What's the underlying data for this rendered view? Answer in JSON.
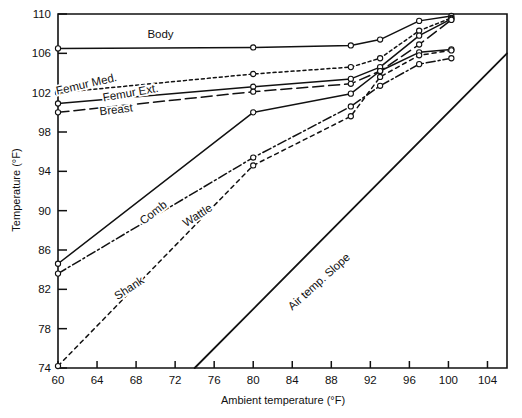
{
  "chart_data": {
    "type": "line",
    "title": "",
    "xlabel": "Ambient temperature (°F)",
    "ylabel": "Temperature (°F)",
    "xlim": [
      60,
      106
    ],
    "ylim": [
      74,
      110
    ],
    "xticks": [
      60,
      64,
      68,
      72,
      76,
      80,
      84,
      88,
      92,
      96,
      100,
      104
    ],
    "yticks": [
      74,
      78,
      82,
      86,
      90,
      94,
      98,
      102,
      106,
      110
    ],
    "grid": false,
    "legend": "inline-labels",
    "line_color": "#111111",
    "background": "#ffffff",
    "series": [
      {
        "name": "Body",
        "label": "Body",
        "style": "solid",
        "marker": "open-circle",
        "label_pos": {
          "x": 70.5,
          "y": 107.6
        },
        "x": [
          60,
          80,
          90,
          93,
          97,
          100.3
        ],
        "y": [
          106.5,
          106.6,
          106.8,
          107.4,
          109.3,
          109.8
        ]
      },
      {
        "name": "Femur Med.",
        "label": "Femur Med.",
        "style": "dotted",
        "marker": "open-circle",
        "label_pos": {
          "x": 63.0,
          "y": 102.5
        },
        "x": [
          60,
          80,
          90,
          93,
          97,
          100.3
        ],
        "y": [
          102.0,
          103.9,
          104.6,
          105.5,
          108.3,
          109.6
        ]
      },
      {
        "name": "Femur Ext.",
        "label": "Femur Ext.",
        "style": "solid",
        "marker": "open-circle",
        "label_pos": {
          "x": 67.5,
          "y": 101.6
        },
        "x": [
          60,
          80,
          90,
          93,
          97,
          100.3
        ],
        "y": [
          100.9,
          102.6,
          103.4,
          104.6,
          107.8,
          109.5
        ]
      },
      {
        "name": "Breast",
        "label": "Breast",
        "style": "dashed",
        "marker": "open-circle",
        "label_pos": {
          "x": 66.0,
          "y": 99.9
        },
        "x": [
          60,
          80,
          90,
          93,
          97,
          100.3
        ],
        "y": [
          100.0,
          102.1,
          102.9,
          104.2,
          106.9,
          109.4
        ]
      },
      {
        "name": "Comb",
        "label": "Comb",
        "style": "solid",
        "marker": "open-circle",
        "label_pos": {
          "x": 70.0,
          "y": 89.5
        },
        "x": [
          60,
          80,
          90,
          93,
          97,
          100.3
        ],
        "y": [
          84.6,
          100.0,
          101.9,
          104.2,
          106.1,
          106.4
        ]
      },
      {
        "name": "Wattle",
        "label": "Wattle",
        "style": "dash-dot",
        "marker": "open-circle",
        "label_pos": {
          "x": 74.5,
          "y": 89.2
        },
        "x": [
          60,
          80,
          90,
          93,
          97,
          100.3
        ],
        "y": [
          83.6,
          95.4,
          100.6,
          102.7,
          104.9,
          105.5
        ]
      },
      {
        "name": "Shank",
        "label": "Shank",
        "style": "short-dash",
        "marker": "open-circle",
        "label_pos": {
          "x": 67.5,
          "y": 81.8
        },
        "x": [
          60,
          80,
          90,
          93,
          97,
          100.3
        ],
        "y": [
          74.2,
          94.6,
          99.6,
          103.6,
          105.8,
          106.3
        ]
      },
      {
        "name": "Air temp. Slope",
        "label": "Air temp. Slope",
        "style": "solid",
        "marker": "none",
        "label_pos": {
          "x": 87.0,
          "y": 82.5
        },
        "x": [
          74,
          106
        ],
        "y": [
          74,
          106
        ]
      }
    ]
  }
}
